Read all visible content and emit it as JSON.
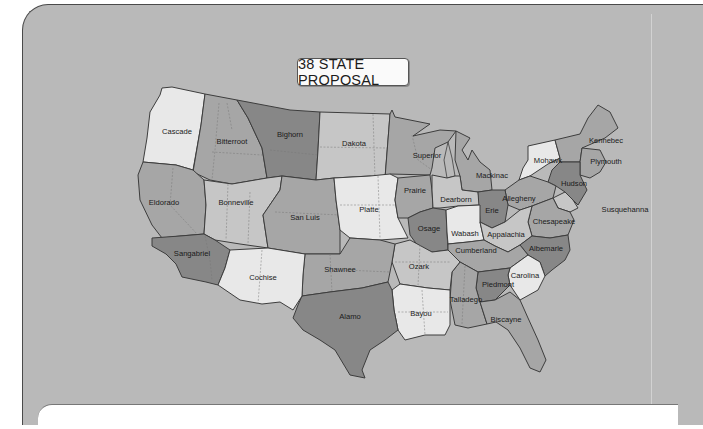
{
  "title": "38 STATE PROPOSAL",
  "colors": {
    "panel_bg": "#b9b9b9",
    "tone_light": "#e8e8e8",
    "tone_medium_light": "#c6c6c6",
    "tone_medium": "#a6a6a6",
    "tone_dark": "#878787",
    "border": "#3d3d3d"
  },
  "regions": [
    {
      "name": "Cascade",
      "tone": "light"
    },
    {
      "name": "Bitterroot",
      "tone": "medium"
    },
    {
      "name": "Bighorn",
      "tone": "dark"
    },
    {
      "name": "Dakota",
      "tone": "medium_light"
    },
    {
      "name": "Superior",
      "tone": "medium"
    },
    {
      "name": "Mackinac",
      "tone": "medium"
    },
    {
      "name": "Mohawk",
      "tone": "light"
    },
    {
      "name": "Kennebec",
      "tone": "medium"
    },
    {
      "name": "Plymouth",
      "tone": "medium"
    },
    {
      "name": "Hudson",
      "tone": "dark"
    },
    {
      "name": "Susquehanna",
      "tone": "medium_light"
    },
    {
      "name": "Eldorado",
      "tone": "medium"
    },
    {
      "name": "Bonneville",
      "tone": "medium_light"
    },
    {
      "name": "San Luis",
      "tone": "medium"
    },
    {
      "name": "Platte",
      "tone": "light"
    },
    {
      "name": "Prairie",
      "tone": "medium"
    },
    {
      "name": "Dearborn",
      "tone": "medium_light"
    },
    {
      "name": "Erie",
      "tone": "dark"
    },
    {
      "name": "Allegheny",
      "tone": "medium"
    },
    {
      "name": "Chesapeake",
      "tone": "medium"
    },
    {
      "name": "Sangabriel",
      "tone": "dark"
    },
    {
      "name": "Cochise",
      "tone": "light"
    },
    {
      "name": "Shawnee",
      "tone": "medium"
    },
    {
      "name": "Osage",
      "tone": "dark"
    },
    {
      "name": "Wabash",
      "tone": "light"
    },
    {
      "name": "Appalachia",
      "tone": "medium_light"
    },
    {
      "name": "Cumberland",
      "tone": "medium"
    },
    {
      "name": "Albemarle",
      "tone": "dark"
    },
    {
      "name": "Ozark",
      "tone": "medium_light"
    },
    {
      "name": "Carolina",
      "tone": "light"
    },
    {
      "name": "Piedmont",
      "tone": "dark"
    },
    {
      "name": "Talladego",
      "tone": "medium"
    },
    {
      "name": "Biscayne",
      "tone": "medium"
    },
    {
      "name": "Alamo",
      "tone": "dark"
    },
    {
      "name": "Bayou",
      "tone": "light"
    }
  ]
}
